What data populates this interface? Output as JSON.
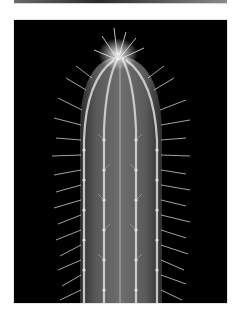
{
  "image": {
    "subject": "columnar cactus with white spines on black background",
    "background_color": "#000000",
    "frame_color": "#ffffff",
    "body_color": "#5e5e5e",
    "rib_color": "#cfcfcf",
    "spine_color": "#e8e8e8"
  }
}
